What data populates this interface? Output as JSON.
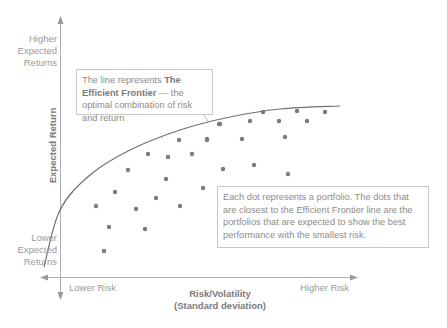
{
  "chart_data": {
    "type": "scatter",
    "title": "Efficient Frontier",
    "xlabel": "Risk/Volatility (Standard deviation)",
    "ylabel": "Expected Return",
    "x_ticks": [
      "Lower Risk",
      "Higher Risk"
    ],
    "y_ticks": [
      "Lower Expected Returns",
      "Higher Expected Returns"
    ],
    "grid": false,
    "units": "pixel coordinates (qualitative chart, no numeric scale)",
    "frontier_curve": [
      [
        44,
        267
      ],
      [
        60,
        210
      ],
      [
        90,
        175
      ],
      [
        130,
        150
      ],
      [
        180,
        130
      ],
      [
        230,
        117
      ],
      [
        280,
        109
      ],
      [
        340,
        106
      ]
    ],
    "series": [
      {
        "name": "Portfolios",
        "points": [
          [
            104,
            251
          ],
          [
            109,
            227
          ],
          [
            145,
            229
          ],
          [
            96,
            206
          ],
          [
            136,
            209
          ],
          [
            180,
            206
          ],
          [
            115,
            192
          ],
          [
            156,
            198
          ],
          [
            128,
            170
          ],
          [
            166,
            179
          ],
          [
            148,
            154
          ],
          [
            168,
            157
          ],
          [
            192,
            154
          ],
          [
            179,
            140
          ],
          [
            207,
            140
          ],
          [
            219,
            124
          ],
          [
            203,
            188
          ],
          [
            220,
            124
          ],
          [
            250,
            121
          ],
          [
            263,
            112
          ],
          [
            279,
            121
          ],
          [
            297,
            111
          ],
          [
            307,
            121
          ],
          [
            325,
            112
          ],
          [
            207,
            139
          ],
          [
            242,
            139
          ],
          [
            285,
            137
          ],
          [
            223,
            169
          ],
          [
            254,
            165
          ],
          [
            288,
            174
          ]
        ]
      }
    ],
    "annotations": [
      "The line represents The Efficient Frontier — the optimal combination of risk and return",
      "Each dot represents a portfolio. The dots that are closest to the Efficient Frontier line are the portfolios that are expected to show the best performance with the smallest risk."
    ]
  },
  "labels": {
    "y_high": "Higher Expected Returns",
    "y_low": "Lower Expected Returns",
    "y_axis_title": "Expected Return",
    "x_low": "Lower Risk",
    "x_high": "Higher Risk",
    "x_axis_title_line1": "Risk/Volatility",
    "x_axis_title_line2": "(Standard deviation)"
  },
  "callouts": {
    "frontier": {
      "prefix": "The line represents ",
      "bold": "The Efficient Frontier",
      "suffix": " — the optimal combination of risk and return"
    },
    "dots": {
      "text": "Each dot represents a portfolio. The dots that are closest to the Efficient Frontier line are the portfolios that are expected to show the best performance with the smallest risk."
    }
  },
  "colors": {
    "axis": "#a8a8a8",
    "curve": "#707070",
    "dot": "#7a7a7a",
    "text": "#9a9a9a"
  }
}
